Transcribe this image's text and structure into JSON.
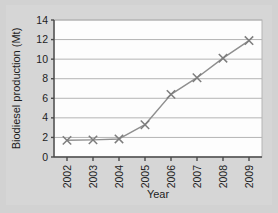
{
  "chart_data": {
    "type": "line",
    "title": "",
    "xlabel": "Year",
    "ylabel": "Biodiesel production (Mt)",
    "categories": [
      "2002",
      "2003",
      "2004",
      "2005",
      "2006",
      "2007",
      "2008",
      "2009"
    ],
    "x": [
      2002,
      2003,
      2004,
      2005,
      2006,
      2007,
      2008,
      2009
    ],
    "values": [
      1.7,
      1.75,
      1.85,
      3.3,
      6.4,
      8.1,
      10.1,
      11.9
    ],
    "series": [
      {
        "name": "Biodiesel production",
        "values": [
          1.7,
          1.75,
          1.85,
          3.3,
          6.4,
          8.1,
          10.1,
          11.9
        ]
      }
    ],
    "ylim": [
      0,
      14
    ],
    "yticks": [
      0,
      2,
      4,
      6,
      8,
      10,
      12,
      14
    ],
    "ytick_labels": [
      "0",
      "2",
      "4",
      "6",
      "8",
      "10",
      "12",
      "14"
    ],
    "xtick_labels": [
      "2002",
      "2003",
      "2004",
      "2005",
      "2006",
      "2007",
      "2008",
      "2009"
    ],
    "xtick_rotation": 90,
    "grid": "horizontal",
    "legend": "none",
    "marker": "x",
    "line_color": "#8f8f8f",
    "marker_color": "#7d7d7d",
    "grid_color": "#b4b4b4",
    "axis_color": "#4a4a4a",
    "plot_background": "#fdfdfd",
    "figure_background": "#d6d6d6",
    "text_color": "#1d1d1d"
  }
}
